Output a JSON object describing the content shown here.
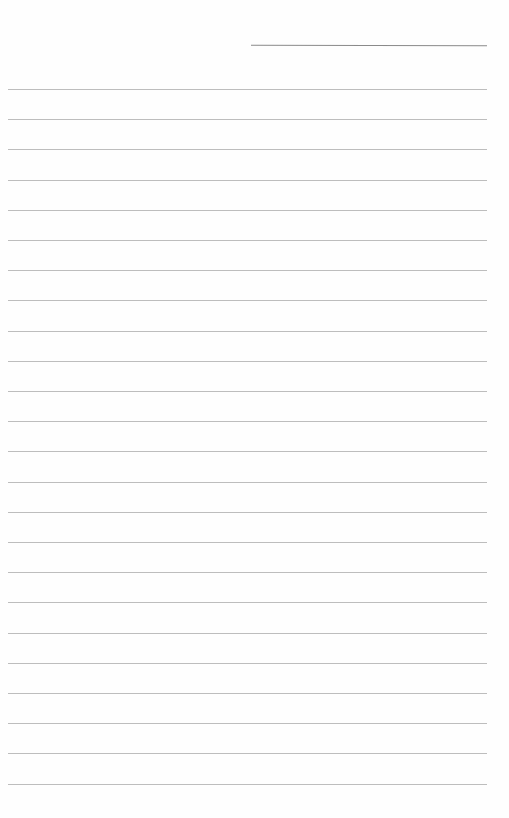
{
  "page": {
    "type": "lined-paper",
    "background_color": "#fefefe",
    "line_color": "#bdbdbd",
    "header_line_color": "#8a8a8a",
    "header_line": {
      "x": 251,
      "y": 45,
      "width": 236
    },
    "rules": {
      "count": 24,
      "first_y": 89,
      "spacing": 30.2,
      "x": 8,
      "width": 479
    },
    "text_lines": []
  }
}
